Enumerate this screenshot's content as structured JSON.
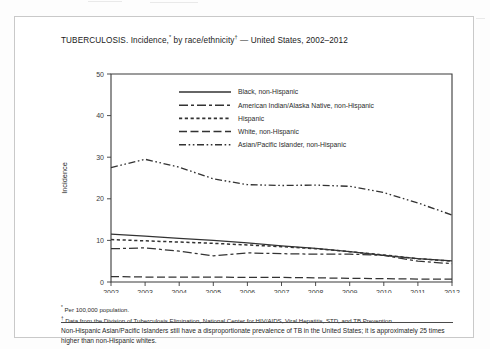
{
  "figure": {
    "title_main": "TUBERCULOSIS. Incidence,",
    "title_sup1": "*",
    "title_mid": " by race/ethnicity",
    "title_sup2": "†",
    "title_tail": " — United States, 2002–2012"
  },
  "footnotes": {
    "first_sup": "*",
    "first": " Per 100,000 population.",
    "second_sup": "†",
    "second": " Data from the Division of Tuberculosis Elimination, National Center for HIV/AIDS, Viral Hepatitis, STD, and TB Prevention."
  },
  "caption": "Non-Hispanic Asian/Pacific Islanders still have a disproportionate prevalence of TB in the United States; it is approximately 25 times higher than non-Hispanic whites.",
  "colors": {
    "ink": "#333333",
    "axis": "#3a3a3a",
    "frame": "#c9c9c9",
    "page": "#ffffff"
  },
  "chart_data": {
    "type": "line",
    "title": "TUBERCULOSIS. Incidence,* by race/ethnicity† — United States, 2002–2012",
    "xlabel": "Year",
    "ylabel": "Incidence",
    "x": [
      2002,
      2003,
      2004,
      2005,
      2006,
      2007,
      2008,
      2009,
      2010,
      2011,
      2012
    ],
    "xtick_labels": [
      "2002",
      "2003",
      "2004",
      "2005",
      "2006",
      "2007",
      "2008",
      "2009",
      "2010",
      "2011",
      "2012"
    ],
    "ytick_labels": [
      "0",
      "10",
      "20",
      "30",
      "40",
      "50"
    ],
    "yticks": [
      0,
      10,
      20,
      30,
      40,
      50
    ],
    "ylim": [
      0,
      50
    ],
    "xlim": [
      2002,
      2012
    ],
    "grid": false,
    "legend_position": "upper-center",
    "series": [
      {
        "name": "Black, non-Hispanic",
        "dash": "none",
        "width": 1.25,
        "values": [
          11.5,
          11.0,
          10.5,
          10.0,
          9.4,
          8.7,
          8.1,
          7.3,
          6.4,
          5.6,
          5.1
        ]
      },
      {
        "name": "American Indian/Alaska Native, non-Hispanic",
        "dash": "9,3,3,3",
        "width": 1.25,
        "values": [
          8.0,
          8.2,
          7.4,
          6.3,
          7.0,
          6.8,
          6.7,
          6.7,
          6.4,
          5.0,
          4.4
        ]
      },
      {
        "name": "Hispanic",
        "dash": "3.2,2.6",
        "width": 1.5,
        "values": [
          10.2,
          9.9,
          9.6,
          9.3,
          8.9,
          8.5,
          8.0,
          7.3,
          6.5,
          5.6,
          5.0
        ]
      },
      {
        "name": "White, non-Hispanic",
        "dash": "8,3.5",
        "width": 1.25,
        "values": [
          1.3,
          1.2,
          1.2,
          1.2,
          1.1,
          1.1,
          1.0,
          0.9,
          0.8,
          0.7,
          0.7
        ]
      },
      {
        "name": "Asian/Pacific Islander, non-Hispanic",
        "dash": "7,2.6,1.6,2.6,1.6,2.6",
        "width": 1.35,
        "values": [
          27.5,
          29.5,
          27.6,
          24.8,
          23.4,
          23.2,
          23.3,
          23.0,
          21.5,
          19.0,
          16.1
        ]
      }
    ]
  }
}
